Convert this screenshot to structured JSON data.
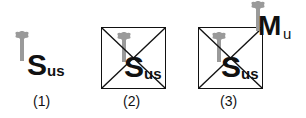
{
  "figures": [
    {
      "id": "1",
      "label": "(1)",
      "symbol": "S",
      "subscript": "us",
      "crossed": false
    },
    {
      "id": "2",
      "label": "(2)",
      "symbol": "S",
      "subscript": "us",
      "crossed": true
    },
    {
      "id": "3",
      "label": "(3)",
      "symbol": "S",
      "subscript": "us",
      "crossed": true,
      "extra": {
        "symbol": "M",
        "subscript": "u"
      }
    }
  ],
  "icons": {
    "key": "key-icon"
  },
  "colors": {
    "key": "#9a9a9a",
    "ink": "#111111"
  }
}
